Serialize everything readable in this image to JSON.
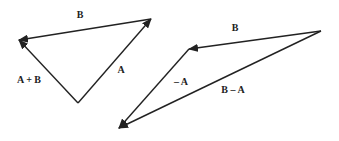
{
  "diagram": {
    "colors": {
      "stroke": "#222222",
      "background": "#ffffff"
    },
    "left_triangle": {
      "name": "vector-sum",
      "vectors": [
        {
          "id": "A",
          "label": "A",
          "from": [
            78,
            103
          ],
          "to": [
            151,
            19
          ],
          "label_pos": [
            121,
            70
          ]
        },
        {
          "id": "B",
          "label": "B",
          "from": [
            151,
            19
          ],
          "to": [
            19,
            40
          ],
          "label_pos": [
            80,
            15
          ]
        },
        {
          "id": "A_plus_B",
          "label": "A + B",
          "from": [
            78,
            103
          ],
          "to": [
            19,
            40
          ],
          "label_pos": [
            29,
            80
          ]
        }
      ]
    },
    "right_triangle": {
      "name": "vector-difference",
      "vectors": [
        {
          "id": "B",
          "label": "B",
          "from": [
            321,
            31
          ],
          "to": [
            189,
            49
          ],
          "label_pos": [
            235,
            28
          ]
        },
        {
          "id": "minus_A",
          "label": "– A",
          "from": [
            189,
            49
          ],
          "to": [
            119,
            128
          ],
          "label_pos": [
            181,
            82
          ]
        },
        {
          "id": "B_minus_A",
          "label": "B – A",
          "from": [
            321,
            31
          ],
          "to": [
            119,
            128
          ],
          "label_pos": [
            233,
            90
          ]
        }
      ]
    }
  }
}
